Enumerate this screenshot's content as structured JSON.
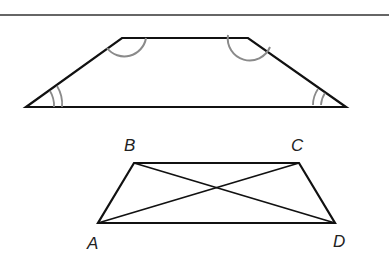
{
  "figure_1": {
    "shape": "isosceles-trapezoid",
    "angle_marks": {
      "top_left": "single-arc",
      "top_right": "single-arc",
      "bottom_left": "double-arc",
      "bottom_right": "double-arc"
    }
  },
  "figure_2": {
    "shape": "isosceles-trapezoid-with-diagonals",
    "vertices": {
      "A": "A",
      "B": "B",
      "C": "C",
      "D": "D"
    },
    "diagonals": [
      "AC",
      "BD"
    ]
  },
  "colors": {
    "line": "#111111",
    "arc": "#8a8a8a",
    "rule": "#333333"
  }
}
